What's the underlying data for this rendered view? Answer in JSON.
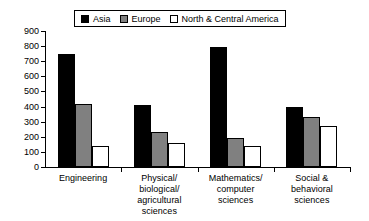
{
  "chart_data": {
    "type": "bar",
    "title": "",
    "xlabel": "",
    "ylabel": "",
    "ylim": [
      0,
      900
    ],
    "ytick_step": 100,
    "yticks": [
      900,
      800,
      700,
      600,
      500,
      400,
      300,
      200,
      100,
      0
    ],
    "grid": false,
    "legend_position": "top-center",
    "categories": [
      "Engineering",
      "Physical/\nbiological/\nagricultural\nsciences",
      "Mathematics/\ncomputer\nsciences",
      "Social &\nbehavioral\nsciences"
    ],
    "series": [
      {
        "name": "Asia",
        "color": "#000000",
        "values": [
          750,
          410,
          795,
          400
        ]
      },
      {
        "name": "Europe",
        "color": "#808080",
        "values": [
          420,
          230,
          190,
          330
        ]
      },
      {
        "name": "North & Central America",
        "color": "#FFFFFF",
        "values": [
          140,
          160,
          140,
          270
        ]
      }
    ]
  },
  "legend": {
    "entries": [
      {
        "label": "Asia",
        "color": "#000000"
      },
      {
        "label": "Europe",
        "color": "#808080"
      },
      {
        "label": "North & Central America",
        "color": "#FFFFFF"
      }
    ]
  },
  "axis": {
    "y_labels": [
      "900",
      "800",
      "700",
      "600",
      "500",
      "400",
      "300",
      "200",
      "100",
      "0"
    ]
  }
}
